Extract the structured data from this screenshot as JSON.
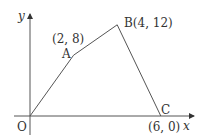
{
  "diagram": {
    "axes": {
      "x_label": "x",
      "y_label": "y",
      "origin_label": "O"
    },
    "points": [
      {
        "name": "O",
        "x": 0,
        "y": 0
      },
      {
        "name": "A",
        "x": 2,
        "y": 8,
        "label": "A",
        "coord_label": "(2, 8)"
      },
      {
        "name": "B",
        "x": 4,
        "y": 12,
        "label": "B(4, 12)"
      },
      {
        "name": "C",
        "x": 6,
        "y": 0,
        "label": "C",
        "coord_label": "(6, 0)"
      }
    ],
    "path": [
      "O",
      "A",
      "B",
      "C"
    ]
  }
}
